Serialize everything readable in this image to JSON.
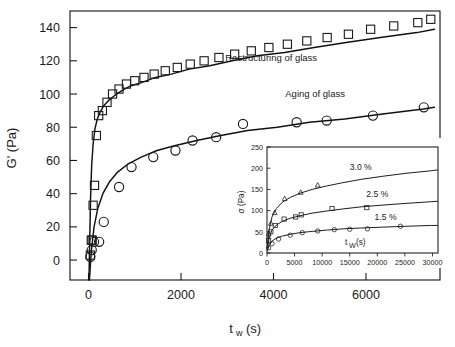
{
  "figure": {
    "background_color": "#ffffff",
    "line_color": "#111111"
  },
  "chart_data": {
    "type": "scatter",
    "title": "",
    "xlabel": "t_w  (s)",
    "ylabel": "G' (Pa)",
    "xlabel_base": "t",
    "xlabel_subscript": "w",
    "xlabel_unit": "(s)",
    "xlim": [
      -400,
      7600
    ],
    "ylim": [
      -12,
      150
    ],
    "xticks": [
      0,
      2000,
      4000,
      6000
    ],
    "xtick_labels": [
      "0",
      "2000",
      "4000",
      "6000"
    ],
    "yticks": [
      0,
      20,
      40,
      60,
      80,
      100,
      120,
      140
    ],
    "ytick_labels": [
      "0",
      "20",
      "40",
      "60",
      "80",
      "100",
      "120",
      "140"
    ],
    "grid": false,
    "legend": "none",
    "annotations": [
      {
        "text": "Restructuring of glass",
        "x": 3950,
        "y": 120
      },
      {
        "text": "Aging of glass",
        "x": 4900,
        "y": 98
      }
    ],
    "series": [
      {
        "name": "Restructuring of glass",
        "marker": "square",
        "x": [
          40,
          60,
          80,
          100,
          130,
          170,
          220,
          300,
          400,
          520,
          660,
          820,
          1000,
          1200,
          1420,
          1660,
          1920,
          2200,
          2500,
          2820,
          3160,
          3520,
          3900,
          4300,
          4720,
          5160,
          5620,
          6100,
          6600,
          7120,
          7400
        ],
        "y": [
          3,
          12,
          12,
          33,
          45,
          75,
          87,
          90,
          95,
          100,
          103,
          106,
          108,
          110,
          112,
          114,
          116,
          118,
          120,
          122,
          124,
          126,
          128,
          130,
          132,
          134,
          136,
          139,
          141,
          143,
          145
        ]
      },
      {
        "name": "Aging of glass",
        "marker": "circle",
        "x": [
          40,
          70,
          120,
          230,
          330,
          660,
          930,
          1400,
          1880,
          2250,
          2760,
          3340,
          4500,
          5150,
          6150,
          7250
        ],
        "y": [
          2,
          6,
          11,
          11,
          23,
          44,
          56,
          62,
          66,
          72,
          74,
          82,
          83,
          84,
          87,
          92
        ]
      }
    ],
    "fits": [
      {
        "name": "Restructuring of glass fit",
        "model": "saturating growth",
        "x": [
          10,
          25,
          45,
          70,
          100,
          140,
          190,
          250,
          330,
          430,
          560,
          720,
          920,
          1160,
          1450,
          1790,
          2180,
          2620,
          3110,
          3650,
          4240,
          4880,
          5570,
          6310,
          7100,
          7480
        ],
        "y": [
          -12,
          10,
          38,
          58,
          70,
          79,
          85,
          89,
          93,
          96,
          99,
          102,
          105,
          107,
          110,
          112,
          115,
          117,
          120,
          123,
          125,
          128,
          131,
          134,
          137,
          139
        ]
      },
      {
        "name": "Aging of glass fit",
        "model": "saturating growth",
        "x": [
          20,
          60,
          120,
          200,
          310,
          450,
          630,
          860,
          1140,
          1480,
          1880,
          2340,
          2860,
          3440,
          4080,
          4780,
          5540,
          6360,
          7240,
          7480
        ],
        "y": [
          -12,
          5,
          20,
          31,
          40,
          47,
          53,
          58,
          62,
          66,
          69,
          72,
          75,
          78,
          80,
          83,
          85,
          88,
          91,
          92
        ]
      }
    ],
    "inset": {
      "type": "scatter",
      "xlabel": "t_W (s)",
      "xlabel_base": "t",
      "xlabel_subscript": "W",
      "xlabel_unit": "(s)",
      "ylabel": "σ (Pa)",
      "xlim": [
        0,
        31000
      ],
      "ylim": [
        0,
        250
      ],
      "xticks": [
        0,
        5000,
        10000,
        15000,
        20000,
        25000,
        30000
      ],
      "xtick_labels": [
        "0",
        "5000",
        "10000",
        "15000",
        "20000",
        "25000",
        "30000"
      ],
      "yticks": [
        0,
        50,
        100,
        150,
        200,
        250
      ],
      "ytick_labels": [
        "0",
        "50",
        "100",
        "150",
        "200",
        "250"
      ],
      "grid": false,
      "annotations": [
        {
          "text": "3.0 %",
          "x": 17000,
          "y": 196
        },
        {
          "text": "2.5 %",
          "x": 20000,
          "y": 133
        },
        {
          "text": "1.5 %",
          "x": 21500,
          "y": 77
        }
      ],
      "series": [
        {
          "name": "3.0 %",
          "marker": "triangle",
          "x": [
            300,
            700,
            1400,
            3200,
            6100,
            9200
          ],
          "y": [
            45,
            70,
            95,
            128,
            143,
            160
          ]
        },
        {
          "name": "2.5 %",
          "marker": "square",
          "x": [
            300,
            700,
            1500,
            3100,
            5200,
            6200,
            11800,
            18100
          ],
          "y": [
            30,
            50,
            65,
            80,
            85,
            90,
            105,
            107
          ]
        },
        {
          "name": "1.5 %",
          "marker": "circle",
          "x": [
            300,
            900,
            2100,
            4200,
            6400,
            9200,
            12200,
            15000,
            18200,
            24200
          ],
          "y": [
            12,
            22,
            33,
            42,
            48,
            52,
            55,
            56,
            57,
            63
          ]
        }
      ],
      "fits": [
        {
          "name": "3.0 % fit",
          "x": [
            100,
            400,
            900,
            1700,
            2800,
            4200,
            6000,
            8200,
            10800,
            13800,
            17200,
            21000,
            25200,
            29800,
            30900
          ],
          "y": [
            20,
            55,
            85,
            105,
            120,
            131,
            141,
            150,
            158,
            166,
            174,
            181,
            188,
            194,
            196
          ]
        },
        {
          "name": "2.5 % fit",
          "x": [
            100,
            400,
            900,
            1700,
            2800,
            4200,
            6000,
            8200,
            10800,
            13800,
            17200,
            21000,
            25200,
            29800,
            30900
          ],
          "y": [
            12,
            35,
            54,
            66,
            75,
            82,
            88,
            94,
            99,
            104,
            109,
            113,
            117,
            121,
            122
          ]
        },
        {
          "name": "1.5 % fit",
          "x": [
            100,
            400,
            900,
            1700,
            2800,
            4200,
            6000,
            8200,
            10800,
            13800,
            17200,
            21000,
            25200,
            29800,
            30900
          ],
          "y": [
            6,
            18,
            28,
            35,
            40,
            44,
            48,
            51,
            54,
            57,
            59,
            61,
            63,
            65,
            65
          ]
        }
      ]
    }
  }
}
